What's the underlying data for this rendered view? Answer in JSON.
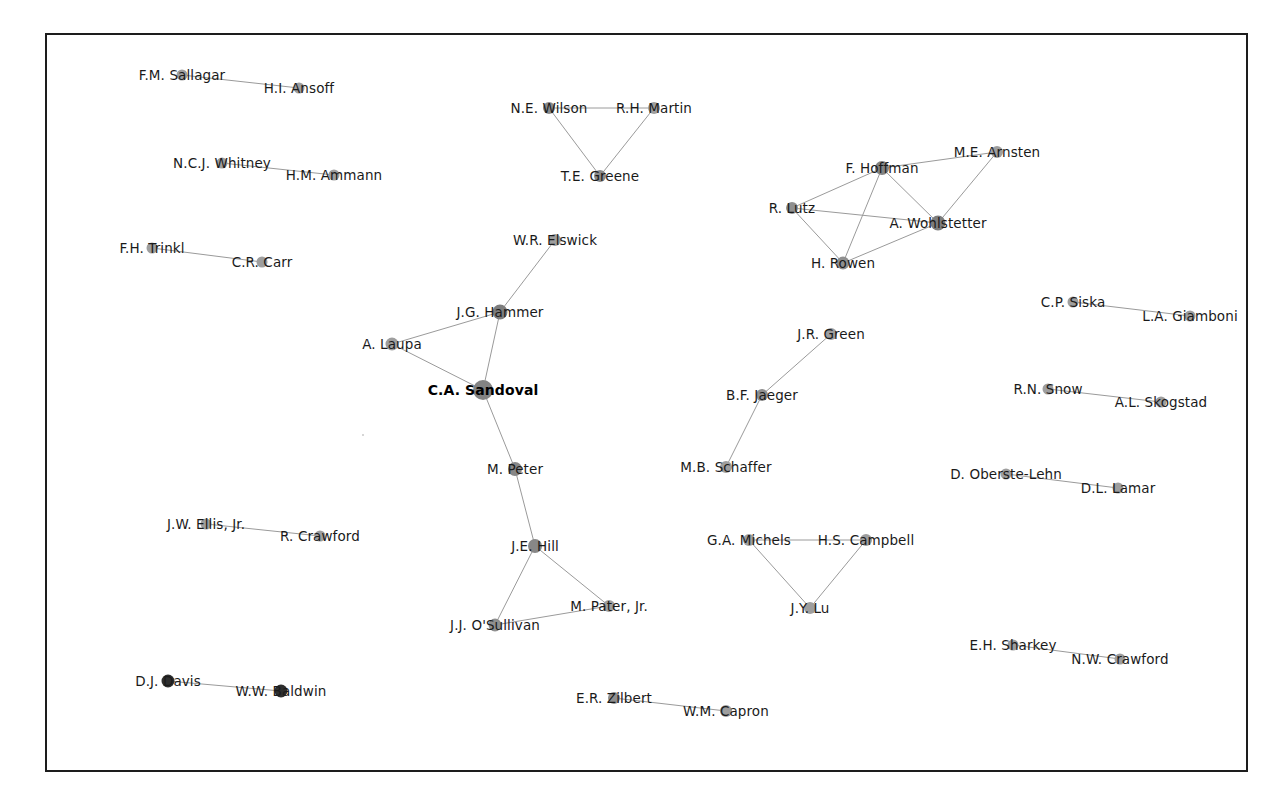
{
  "figure": {
    "type": "network-graph",
    "background": "#ffffff",
    "frame": {
      "x": 45,
      "y": 33,
      "width": 1203,
      "height": 739,
      "border_color": "#1d1d1d",
      "border_width": 2
    },
    "edge_color": "#9a9a9a",
    "default_node_color": "#9e9e9e",
    "highlight_node_color": "#808080",
    "dark_node_color": "#2e2e2e"
  },
  "chart_data": {
    "type": "network",
    "title": "",
    "node_count": 39,
    "edge_count": 27,
    "nodes": [
      {
        "id": "sallagar",
        "label": "F.M. Sallagar",
        "x": 182,
        "y": 75,
        "r": 5.5,
        "color": "#9e9e9e",
        "label_dx": 0,
        "label_dy": 0
      },
      {
        "id": "ansoff",
        "label": "H.I. Ansoff",
        "x": 299,
        "y": 88,
        "r": 5.5,
        "color": "#9e9e9e",
        "label_dx": 0,
        "label_dy": 0
      },
      {
        "id": "whitney",
        "label": "N.C.J. Whitney",
        "x": 222,
        "y": 163,
        "r": 5.5,
        "color": "#9e9e9e",
        "label_dx": 0,
        "label_dy": 0
      },
      {
        "id": "ammann",
        "label": "H.M. Ammann",
        "x": 334,
        "y": 175,
        "r": 5.5,
        "color": "#9e9e9e",
        "label_dx": 0,
        "label_dy": 0
      },
      {
        "id": "trinkl",
        "label": "F.H. Trinkl",
        "x": 152,
        "y": 248,
        "r": 5.5,
        "color": "#9e9e9e",
        "label_dx": 0,
        "label_dy": 0
      },
      {
        "id": "carr",
        "label": "C.R. Carr",
        "x": 262,
        "y": 262,
        "r": 5.5,
        "color": "#9e9e9e",
        "label_dx": 0,
        "label_dy": 0
      },
      {
        "id": "wilson",
        "label": "N.E. Wilson",
        "x": 549,
        "y": 108,
        "r": 6.0,
        "color": "#8a8a8a",
        "label_dx": 0,
        "label_dy": 0
      },
      {
        "id": "martin",
        "label": "R.H. Martin",
        "x": 654,
        "y": 108,
        "r": 6.0,
        "color": "#9e9e9e",
        "label_dx": 0,
        "label_dy": 0
      },
      {
        "id": "greene",
        "label": "T.E. Greene",
        "x": 600,
        "y": 176,
        "r": 6.0,
        "color": "#8a8a8a",
        "label_dx": 0,
        "label_dy": 0
      },
      {
        "id": "elswick",
        "label": "W.R. Elswick",
        "x": 555,
        "y": 240,
        "r": 6.0,
        "color": "#9e9e9e",
        "label_dx": 0,
        "label_dy": 0
      },
      {
        "id": "hammer",
        "label": "J.G. Hammer",
        "x": 500,
        "y": 312,
        "r": 7.5,
        "color": "#7d7d7d",
        "label_dx": 0,
        "label_dy": 0
      },
      {
        "id": "laupa",
        "label": "A. Laupa",
        "x": 392,
        "y": 344,
        "r": 6.5,
        "color": "#9e9e9e",
        "label_dx": 0,
        "label_dy": 0
      },
      {
        "id": "sandoval",
        "label": "C.A. Sandoval",
        "x": 483,
        "y": 390,
        "r": 10.0,
        "color": "#838383",
        "label_dx": 0,
        "label_dy": 0,
        "bold": true
      },
      {
        "id": "mpeter",
        "label": "M. Peter",
        "x": 515,
        "y": 469,
        "r": 7.0,
        "color": "#878787",
        "label_dx": 0,
        "label_dy": 0
      },
      {
        "id": "hill",
        "label": "J.E. Hill",
        "x": 535,
        "y": 546,
        "r": 7.0,
        "color": "#878787",
        "label_dx": 0,
        "label_dy": 0
      },
      {
        "id": "osullivan",
        "label": "J.J. O'Sullivan",
        "x": 495,
        "y": 625,
        "r": 6.5,
        "color": "#8f8f8f",
        "label_dx": 0,
        "label_dy": 0
      },
      {
        "id": "pater",
        "label": "M. Pater, Jr.",
        "x": 609,
        "y": 606,
        "r": 6.0,
        "color": "#9e9e9e",
        "label_dx": 0,
        "label_dy": 0
      },
      {
        "id": "hoffman",
        "label": "F. Hoffman",
        "x": 882,
        "y": 168,
        "r": 7.0,
        "color": "#838383",
        "label_dx": 0,
        "label_dy": 0
      },
      {
        "id": "arnsten",
        "label": "M.E. Arnsten",
        "x": 997,
        "y": 152,
        "r": 6.0,
        "color": "#9e9e9e",
        "label_dx": 0,
        "label_dy": 0
      },
      {
        "id": "lutz",
        "label": "R. Lutz",
        "x": 792,
        "y": 208,
        "r": 6.0,
        "color": "#8f8f8f",
        "label_dx": 0,
        "label_dy": 0
      },
      {
        "id": "wohlstetter",
        "label": "A. Wohlstetter",
        "x": 938,
        "y": 223,
        "r": 7.5,
        "color": "#7d7d7d",
        "label_dx": 0,
        "label_dy": 0
      },
      {
        "id": "rowen",
        "label": "H. Rowen",
        "x": 843,
        "y": 263,
        "r": 6.5,
        "color": "#8f8f8f",
        "label_dx": 0,
        "label_dy": 0
      },
      {
        "id": "siska",
        "label": "C.P. Siska",
        "x": 1073,
        "y": 302,
        "r": 5.5,
        "color": "#9e9e9e",
        "label_dx": 0,
        "label_dy": 0
      },
      {
        "id": "giamboni",
        "label": "L.A. Giamboni",
        "x": 1190,
        "y": 316,
        "r": 5.5,
        "color": "#9e9e9e",
        "label_dx": 0,
        "label_dy": 0
      },
      {
        "id": "jrgreen",
        "label": "J.R. Green",
        "x": 831,
        "y": 334,
        "r": 6.0,
        "color": "#9e9e9e",
        "label_dx": 0,
        "label_dy": 0
      },
      {
        "id": "jaeger",
        "label": "B.F. Jaeger",
        "x": 762,
        "y": 395,
        "r": 6.0,
        "color": "#8f8f8f",
        "label_dx": 0,
        "label_dy": 0
      },
      {
        "id": "schaffer",
        "label": "M.B. Schaffer",
        "x": 726,
        "y": 467,
        "r": 6.0,
        "color": "#9e9e9e",
        "label_dx": 0,
        "label_dy": 0
      },
      {
        "id": "snow",
        "label": "R.N. Snow",
        "x": 1048,
        "y": 389,
        "r": 5.5,
        "color": "#9e9e9e",
        "label_dx": 0,
        "label_dy": 0
      },
      {
        "id": "skogstad",
        "label": "A.L. Skogstad",
        "x": 1161,
        "y": 402,
        "r": 5.5,
        "color": "#9e9e9e",
        "label_dx": 0,
        "label_dy": 0
      },
      {
        "id": "obersteLehn",
        "label": "D. Oberste-Lehn",
        "x": 1006,
        "y": 474,
        "r": 5.5,
        "color": "#9e9e9e",
        "label_dx": 0,
        "label_dy": 0
      },
      {
        "id": "lamar",
        "label": "D.L. Lamar",
        "x": 1118,
        "y": 488,
        "r": 5.5,
        "color": "#9e9e9e",
        "label_dx": 0,
        "label_dy": 0
      },
      {
        "id": "ellis",
        "label": "J.W. Ellis, Jr.",
        "x": 206,
        "y": 524,
        "r": 5.5,
        "color": "#9e9e9e",
        "label_dx": 0,
        "label_dy": 0
      },
      {
        "id": "rcrawford",
        "label": "R. Crawford",
        "x": 320,
        "y": 536,
        "r": 5.5,
        "color": "#9e9e9e",
        "label_dx": 0,
        "label_dy": 0
      },
      {
        "id": "michels",
        "label": "G.A. Michels",
        "x": 749,
        "y": 540,
        "r": 6.0,
        "color": "#9e9e9e",
        "label_dx": 0,
        "label_dy": 0
      },
      {
        "id": "campbell",
        "label": "H.S. Campbell",
        "x": 866,
        "y": 540,
        "r": 6.0,
        "color": "#9e9e9e",
        "label_dx": 0,
        "label_dy": 0
      },
      {
        "id": "lu",
        "label": "J.Y. Lu",
        "x": 810,
        "y": 608,
        "r": 6.0,
        "color": "#9e9e9e",
        "label_dx": 0,
        "label_dy": 0
      },
      {
        "id": "sharkey",
        "label": "E.H. Sharkey",
        "x": 1013,
        "y": 645,
        "r": 5.5,
        "color": "#9e9e9e",
        "label_dx": 0,
        "label_dy": 0
      },
      {
        "id": "nwcrawford",
        "label": "N.W. Crawford",
        "x": 1120,
        "y": 659,
        "r": 5.5,
        "color": "#9e9e9e",
        "label_dx": 0,
        "label_dy": 0
      },
      {
        "id": "davis",
        "label": "D.J. Davis",
        "x": 168,
        "y": 681,
        "r": 6.5,
        "color": "#2e2e2e",
        "label_dx": 0,
        "label_dy": 0
      },
      {
        "id": "baldwin",
        "label": "W.W. Baldwin",
        "x": 281,
        "y": 691,
        "r": 6.5,
        "color": "#2e2e2e",
        "label_dx": 0,
        "label_dy": 0
      },
      {
        "id": "zilbert",
        "label": "E.R. Zilbert",
        "x": 614,
        "y": 698,
        "r": 6.0,
        "color": "#8f8f8f",
        "label_dx": 0,
        "label_dy": 0
      },
      {
        "id": "capron",
        "label": "W.M. Capron",
        "x": 726,
        "y": 711,
        "r": 6.0,
        "color": "#9e9e9e",
        "label_dx": 0,
        "label_dy": 0
      }
    ],
    "edges": [
      {
        "source": "sallagar",
        "target": "ansoff"
      },
      {
        "source": "whitney",
        "target": "ammann"
      },
      {
        "source": "trinkl",
        "target": "carr"
      },
      {
        "source": "wilson",
        "target": "martin"
      },
      {
        "source": "wilson",
        "target": "greene"
      },
      {
        "source": "martin",
        "target": "greene"
      },
      {
        "source": "elswick",
        "target": "hammer"
      },
      {
        "source": "hammer",
        "target": "laupa"
      },
      {
        "source": "hammer",
        "target": "sandoval"
      },
      {
        "source": "laupa",
        "target": "sandoval"
      },
      {
        "source": "sandoval",
        "target": "mpeter"
      },
      {
        "source": "mpeter",
        "target": "hill"
      },
      {
        "source": "hill",
        "target": "osullivan"
      },
      {
        "source": "hill",
        "target": "pater"
      },
      {
        "source": "osullivan",
        "target": "pater"
      },
      {
        "source": "lutz",
        "target": "hoffman"
      },
      {
        "source": "lutz",
        "target": "rowen"
      },
      {
        "source": "lutz",
        "target": "wohlstetter"
      },
      {
        "source": "hoffman",
        "target": "rowen"
      },
      {
        "source": "hoffman",
        "target": "wohlstetter"
      },
      {
        "source": "hoffman",
        "target": "arnsten"
      },
      {
        "source": "rowen",
        "target": "wohlstetter"
      },
      {
        "source": "arnsten",
        "target": "wohlstetter"
      },
      {
        "source": "siska",
        "target": "giamboni"
      },
      {
        "source": "jrgreen",
        "target": "jaeger"
      },
      {
        "source": "jaeger",
        "target": "schaffer"
      },
      {
        "source": "snow",
        "target": "skogstad"
      },
      {
        "source": "obersteLehn",
        "target": "lamar"
      },
      {
        "source": "ellis",
        "target": "rcrawford"
      },
      {
        "source": "michels",
        "target": "campbell"
      },
      {
        "source": "michels",
        "target": "lu"
      },
      {
        "source": "campbell",
        "target": "lu"
      },
      {
        "source": "sharkey",
        "target": "nwcrawford"
      },
      {
        "source": "davis",
        "target": "baldwin"
      },
      {
        "source": "zilbert",
        "target": "capron"
      }
    ],
    "stray_marks": [
      {
        "x": 362,
        "y": 434
      }
    ]
  }
}
